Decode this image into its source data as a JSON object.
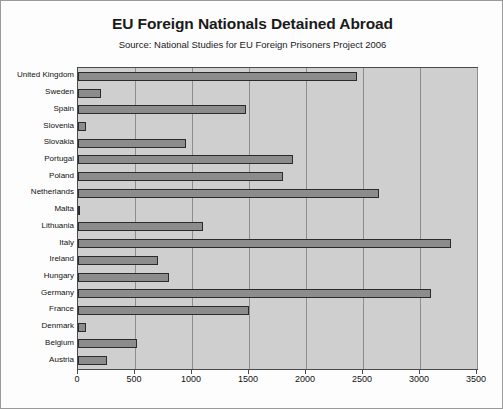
{
  "chart_data": {
    "type": "bar",
    "orientation": "horizontal",
    "title": "EU Foreign Nationals Detained Abroad",
    "subtitle": "Source: National Studies for EU Foreign Prisoners Project 2006",
    "xlabel": "",
    "ylabel": "",
    "categories": [
      "United Kingdom",
      "Sweden",
      "Spain",
      "Slovenia",
      "Slovakia",
      "Portugal",
      "Poland",
      "Netherlands",
      "Malta",
      "Lithuania",
      "Italy",
      "Ireland",
      "Hungary",
      "Germany",
      "France",
      "Denmark",
      "Belgium",
      "Austria"
    ],
    "values": [
      2450,
      200,
      1470,
      70,
      950,
      1890,
      1800,
      2640,
      20,
      1100,
      3270,
      700,
      800,
      3100,
      1500,
      70,
      520,
      250
    ],
    "xlim": [
      0,
      3500
    ],
    "xticks": [
      0,
      500,
      1000,
      1500,
      2000,
      2500,
      3000,
      3500
    ],
    "xtick_labels": [
      "0",
      "500",
      "1000",
      "1500",
      "2000",
      "2500",
      "3000",
      "3500"
    ],
    "grid": true,
    "grid_axis": "x",
    "legend": false,
    "colors": {
      "bar_fill": "#8c8c8c",
      "bar_edge": "#2b2b2b",
      "plot_background": "#cfcfcf",
      "gridline": "#8d8d8d",
      "figure_background": "#fdfdfd",
      "figure_border": "#9a9a9a",
      "text": "#111111"
    }
  }
}
